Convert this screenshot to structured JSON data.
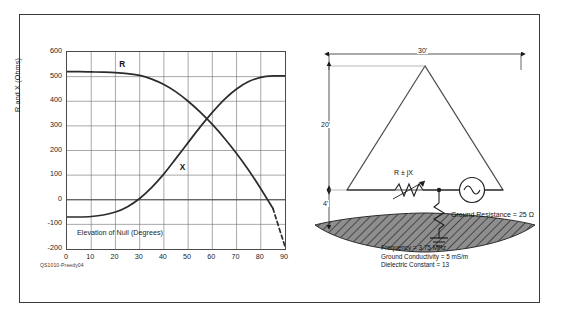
{
  "figure": {
    "credit": "QS1010-Preedy04"
  },
  "chart_data": {
    "type": "line",
    "title": "",
    "xlabel": "Elevation of Null (Degrees)",
    "ylabel": "R and X (Ohms)",
    "xlim": [
      0,
      90
    ],
    "ylim": [
      -200,
      600
    ],
    "xticks": [
      0,
      10,
      20,
      30,
      40,
      50,
      60,
      70,
      80,
      90
    ],
    "yticks": [
      600,
      500,
      400,
      300,
      200,
      100,
      0,
      -100,
      -200
    ],
    "grid": true,
    "legend": "inline-labels",
    "x": [
      0,
      5,
      10,
      15,
      20,
      25,
      30,
      35,
      40,
      45,
      50,
      55,
      60,
      65,
      70,
      75,
      80,
      85,
      90
    ],
    "series": [
      {
        "name": "R",
        "label": "R",
        "values": [
          520,
          520,
          519,
          518,
          516,
          512,
          505,
          490,
          468,
          438,
          400,
          356,
          306,
          250,
          188,
          120,
          45,
          -35,
          -190
        ],
        "dashed_from_x": 85,
        "label_x": 22,
        "label_y": 565
      },
      {
        "name": "X",
        "label": "X",
        "values": [
          -70,
          -70,
          -68,
          -62,
          -50,
          -28,
          5,
          50,
          105,
          168,
          232,
          296,
          355,
          408,
          450,
          480,
          497,
          503,
          503
        ],
        "dashed_from_x": null,
        "label_x": 47,
        "label_y": 145
      }
    ]
  },
  "antenna": {
    "dimensions": {
      "width_label": "30'",
      "height_label": "20'",
      "base_height_label": "4'"
    },
    "components": {
      "impedance_label": "R ± jX",
      "ground_resistance_label": "Ground Resistance = 25 Ω",
      "source_name": "ac-source"
    },
    "specs": "Frequency = 3.75 MHz\nGround Conductivity = 5 mS/m\nDielectric Constant = 13"
  }
}
